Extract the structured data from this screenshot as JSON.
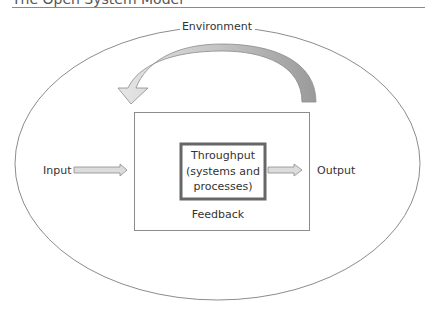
{
  "header": {
    "title": "The Open System Model"
  },
  "diagram": {
    "environment_label": "Environment",
    "input_label": "Input",
    "output_label": "Output",
    "throughput_line1": "Throughput",
    "throughput_line2": "(systems and",
    "throughput_line3": "processes)",
    "feedback_label": "Feedback"
  },
  "colors": {
    "ellipse_stroke": "#8c8c8c",
    "box_stroke": "#8c8c8c",
    "throughput_border": "#666666",
    "arrow_fill": "#d9d9d9",
    "arrow_stroke": "#8c8c8c",
    "feedback_arrow_dark": "#9a9a9a",
    "feedback_arrow_light": "#e4e4e4"
  }
}
